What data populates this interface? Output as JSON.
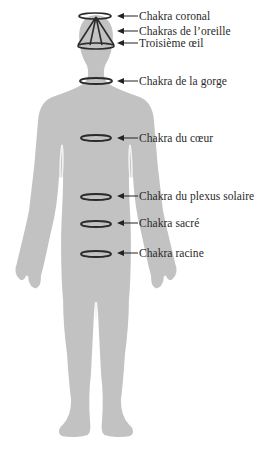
{
  "diagram": {
    "type": "chakra-body-map",
    "colors": {
      "body_fill": "#c2c2c2",
      "body_outline": "#ffffff",
      "ring_stroke": "#2b2b2b",
      "arrow": "#222222",
      "text": "#2a2a2a",
      "background": "#ffffff"
    },
    "labels": [
      {
        "id": "crown",
        "text": "Chakra coronal",
        "y": 16
      },
      {
        "id": "ear",
        "text": "Chakras de l’oreille",
        "y": 31
      },
      {
        "id": "third-eye",
        "text": "Troisième œil",
        "y": 43
      },
      {
        "id": "throat",
        "text": "Chakra de la gorge",
        "y": 81
      },
      {
        "id": "heart",
        "text": "Chakra du cœur",
        "y": 138
      },
      {
        "id": "solar-plexus",
        "text": "Chakra du plexus solaire",
        "y": 196
      },
      {
        "id": "sacral",
        "text": "Chakra sacré",
        "y": 223
      },
      {
        "id": "root",
        "text": "Chakra racine",
        "y": 253
      }
    ]
  }
}
